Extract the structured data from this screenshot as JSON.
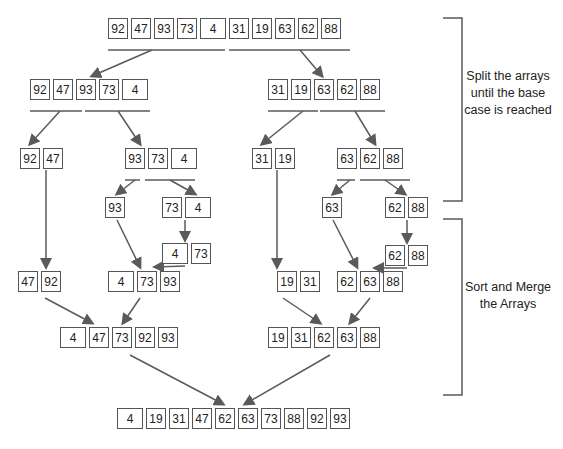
{
  "diagram": {
    "arrays": {
      "root": {
        "values": [
          92,
          47,
          93,
          73,
          4,
          31,
          19,
          63,
          62,
          88
        ],
        "x": 108,
        "y": 18
      },
      "l": {
        "values": [
          92,
          47,
          93,
          73,
          4
        ],
        "x": 30,
        "y": 79
      },
      "r": {
        "values": [
          31,
          19,
          63,
          62,
          88
        ],
        "x": 268,
        "y": 79
      },
      "ll": {
        "values": [
          92,
          47
        ],
        "x": 20,
        "y": 148
      },
      "lr": {
        "values": [
          93,
          73,
          4
        ],
        "x": 125,
        "y": 148
      },
      "rl": {
        "values": [
          31,
          19
        ],
        "x": 252,
        "y": 148
      },
      "rr": {
        "values": [
          63,
          62,
          88
        ],
        "x": 337,
        "y": 148
      },
      "lrl": {
        "values": [
          93
        ],
        "x": 105,
        "y": 197
      },
      "lrr": {
        "values": [
          73,
          4
        ],
        "x": 162,
        "y": 197
      },
      "rrl": {
        "values": [
          63
        ],
        "x": 322,
        "y": 197
      },
      "rrr": {
        "values": [
          62,
          88
        ],
        "x": 385,
        "y": 197
      },
      "lrr_sorted": {
        "values": [
          4,
          73
        ],
        "x": 162,
        "y": 243
      },
      "rrr_sorted": {
        "values": [
          62,
          88
        ],
        "x": 385,
        "y": 245
      },
      "ll_sorted": {
        "values": [
          47,
          92
        ],
        "x": 18,
        "y": 271
      },
      "lr_sorted": {
        "values": [
          4,
          73,
          93
        ],
        "x": 108,
        "y": 271
      },
      "rl_sorted": {
        "values": [
          19,
          31
        ],
        "x": 277,
        "y": 271
      },
      "rr_sorted": {
        "values": [
          62,
          63,
          88
        ],
        "x": 337,
        "y": 271
      },
      "l_sorted": {
        "values": [
          4,
          47,
          73,
          92,
          93
        ],
        "x": 60,
        "y": 327
      },
      "r_sorted": {
        "values": [
          19,
          31,
          62,
          63,
          88
        ],
        "x": 268,
        "y": 327
      },
      "result": {
        "values": [
          4,
          19,
          31,
          47,
          62,
          63,
          73,
          88,
          92,
          93
        ],
        "x": 117,
        "y": 408
      }
    },
    "annotations": {
      "split": "Split the arrays until the base case is reached",
      "merge": "Sort and Merge the Arrays"
    },
    "colors": {
      "stroke": "#555555",
      "arrow": "#5a5a5a",
      "text": "#222222"
    }
  }
}
